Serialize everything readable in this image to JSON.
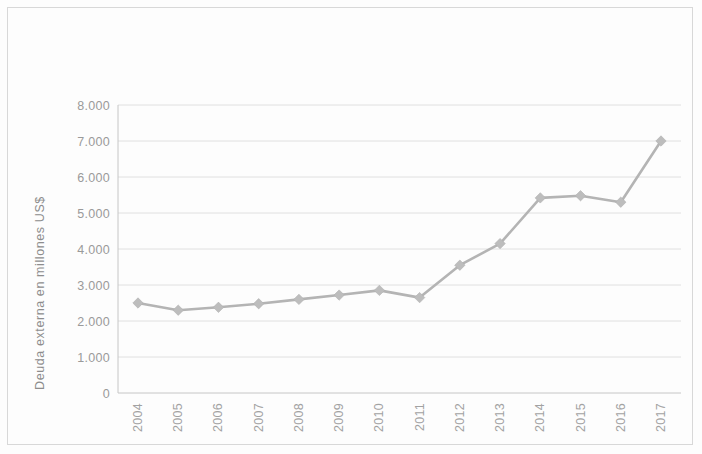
{
  "chart_data": {
    "type": "line",
    "title": "",
    "subtitle": "",
    "xlabel": "",
    "ylabel": "Deuda externa en millones US$",
    "categories": [
      "2004",
      "2005",
      "2006",
      "2007",
      "2008",
      "2009",
      "2010",
      "2011",
      "2012",
      "2013",
      "2014",
      "2015",
      "2016",
      "2017"
    ],
    "values": [
      2500,
      2300,
      2380,
      2480,
      2600,
      2720,
      2850,
      2650,
      3550,
      4150,
      5420,
      5480,
      5300,
      7000
    ],
    "series": [
      {
        "name": "Deuda externa",
        "values": [
          2500,
          2300,
          2380,
          2480,
          2600,
          2720,
          2850,
          2650,
          3550,
          4150,
          5420,
          5480,
          5300,
          7000
        ]
      }
    ],
    "ylim": [
      0,
      8000
    ],
    "ytick_labels": [
      "8.000",
      "7.000",
      "6.000",
      "5.000",
      "4.000",
      "3.000",
      "2.000",
      "1.000",
      "0"
    ],
    "ytick_values": [
      8000,
      7000,
      6000,
      5000,
      4000,
      3000,
      2000,
      1000,
      0
    ],
    "grid": true,
    "legend": "none",
    "marker": "diamond",
    "line_color": "#b4b4b4",
    "marker_color": "#bdbdbd",
    "grid_color": "#dcdcdc",
    "axis_color": "#c6c6c6",
    "text_color": "#9a9a9a",
    "background_color": "#fdfdfd",
    "xtick_rotation": -90,
    "annotations": []
  }
}
